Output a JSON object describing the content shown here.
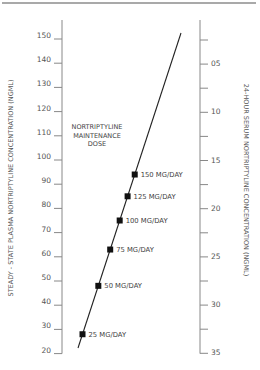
{
  "chart_data": {
    "type": "line",
    "title": "",
    "annotation": [
      "NORTRIPTYLINE",
      "MAINTENANCE",
      "DOSE"
    ],
    "ylabel": "STEADY - STATE PLASMA NORTRIPTYLINE CONCENTRATION (NGML)",
    "y2label": "24-HOUR SERUM NORTRIPTYLINE CONCENTRATION (NGML)",
    "ylim": [
      20,
      150
    ],
    "y_ticks": [
      150,
      140,
      130,
      120,
      110,
      100,
      90,
      80,
      70,
      60,
      50,
      40,
      30,
      20
    ],
    "y2_ticks_labeled": [
      "05",
      "10",
      "15",
      "20",
      "25",
      "30",
      "35"
    ],
    "y2_inverted": true,
    "grid": false,
    "legend": null,
    "series": [
      {
        "name": "Nortriptyline maintenance dose",
        "points": [
          {
            "label": "25 MG/DAY",
            "dose_mg_day": 25,
            "y": 28
          },
          {
            "label": "50 MG/DAY",
            "dose_mg_day": 50,
            "y": 48
          },
          {
            "label": "75 MG/DAY",
            "dose_mg_day": 75,
            "y": 63
          },
          {
            "label": "100 MG/DAY",
            "dose_mg_day": 100,
            "y": 75
          },
          {
            "label": "125 MG/DAY",
            "dose_mg_day": 125,
            "y": 85
          },
          {
            "label": "150 MG/DAY",
            "dose_mg_day": 150,
            "y": 94
          }
        ],
        "line_start": {
          "x_px": 78,
          "y_px": 348
        },
        "line_end": {
          "x_px": 181,
          "y_px": 33
        }
      }
    ]
  },
  "colors": {
    "axis": "#888888",
    "line": "#222222",
    "marker": "#111111",
    "text": "#444444",
    "border": "#555555"
  }
}
